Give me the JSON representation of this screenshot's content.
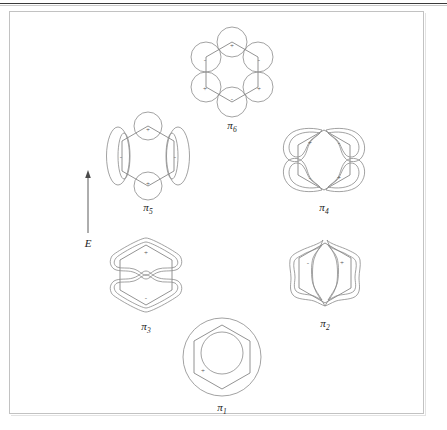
{
  "figure": {
    "type": "molecular-orbital-diagram",
    "energy_axis": {
      "label": "E",
      "direction": "increasing upward",
      "icon": "up-arrow-icon"
    },
    "orbitals": [
      {
        "id": "pi1",
        "label_base": "π",
        "label_sub": "1",
        "nodes": 0,
        "level": 1,
        "description": "lowest bonding orbital, single delocalized lobe over whole ring",
        "signs": [
          "+"
        ]
      },
      {
        "id": "pi2",
        "label_base": "π",
        "label_sub": "2",
        "nodes": 1,
        "level": 2,
        "description": "bonding, vertical nodal plane, left and right lobes",
        "signs": [
          "-",
          "+"
        ]
      },
      {
        "id": "pi3",
        "label_base": "π",
        "label_sub": "3",
        "nodes": 1,
        "level": 2,
        "description": "bonding, horizontal nodal plane, top and bottom lobes",
        "signs": [
          "+",
          "-"
        ]
      },
      {
        "id": "pi4",
        "label_base": "π",
        "label_sub": "4",
        "nodes": 2,
        "level": 3,
        "description": "antibonding, four curved lobes around ring",
        "signs": [
          "+",
          "-",
          "-",
          "+"
        ]
      },
      {
        "id": "pi5",
        "label_base": "π",
        "label_sub": "5",
        "nodes": 2,
        "level": 3,
        "description": "antibonding, top and bottom circles plus side ellipses",
        "signs": [
          "+",
          "-",
          "-",
          "+"
        ]
      },
      {
        "id": "pi6",
        "label_base": "π",
        "label_sub": "6",
        "nodes": 3,
        "level": 4,
        "description": "highest antibonding orbital, alternating signs on all six carbons",
        "signs": [
          "+",
          "-",
          "-",
          "+",
          "+",
          "-"
        ]
      }
    ],
    "colors": {
      "stroke": "#8a8a8a",
      "bond": "#777777",
      "label": "#1c1c1c",
      "frame": "#c2c2c2",
      "rule": "#3a3a3a",
      "background": "#ffffff"
    }
  }
}
